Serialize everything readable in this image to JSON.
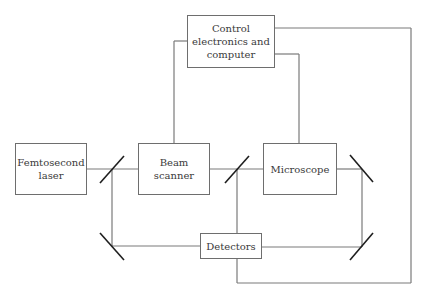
{
  "diagram": {
    "colors": {
      "connector": "#7a7a7a",
      "mirror": "#1e1e1e",
      "box_border": "#6e6e6e",
      "text": "#3a3a3a"
    },
    "nodes": {
      "laser": {
        "label": "Femtosecond\nlaser"
      },
      "scanner": {
        "label": "Beam\nscanner"
      },
      "control": {
        "label": "Control\nelectronics and\ncomputer"
      },
      "microscope": {
        "label": "Microscope"
      },
      "detectors": {
        "label": "Detectors"
      }
    },
    "mirrors": [
      {
        "id": "mirror-1",
        "position": "between laser and beam scanner"
      },
      {
        "id": "mirror-2",
        "position": "between beam scanner and microscope"
      },
      {
        "id": "mirror-3",
        "position": "right of microscope"
      },
      {
        "id": "mirror-4",
        "position": "lower left"
      },
      {
        "id": "mirror-5",
        "position": "lower right"
      }
    ],
    "edges": [
      [
        "laser",
        "mirror-1"
      ],
      [
        "mirror-1",
        "scanner"
      ],
      [
        "scanner",
        "mirror-2"
      ],
      [
        "mirror-2",
        "microscope"
      ],
      [
        "microscope",
        "mirror-3"
      ],
      [
        "mirror-3",
        "mirror-5"
      ],
      [
        "mirror-5",
        "detectors"
      ],
      [
        "mirror-1",
        "mirror-4"
      ],
      [
        "mirror-4",
        "detectors"
      ],
      [
        "mirror-2",
        "detectors"
      ],
      [
        "control",
        "scanner"
      ],
      [
        "control",
        "microscope"
      ],
      [
        "control",
        "detectors"
      ]
    ]
  }
}
